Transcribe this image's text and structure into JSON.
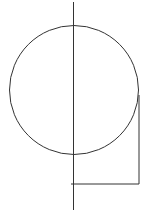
{
  "canvas": {
    "width": 161,
    "height": 217,
    "background": "#ffffff"
  },
  "stroke": {
    "color": "#333333",
    "width": 1
  },
  "diagram": {
    "circle": {
      "cx": 74,
      "cy": 90,
      "r": 64.5
    },
    "axis_line": {
      "x1": 73.5,
      "y1": 2,
      "x2": 73.5,
      "y2": 210
    },
    "bracket": {
      "vertical": {
        "x1": 139,
        "y1": 95,
        "x2": 139,
        "y2": 184
      },
      "horizontal": {
        "x1": 71,
        "y1": 184,
        "x2": 139,
        "y2": 184
      }
    }
  }
}
